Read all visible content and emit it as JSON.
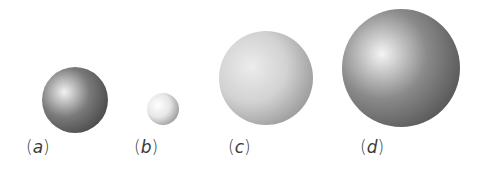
{
  "figure": {
    "spheres": [
      {
        "id": "a",
        "label_letter": "a",
        "open_paren": "(",
        "close_paren": ")",
        "cx": 75,
        "cy": 100,
        "r": 33,
        "colors": {
          "highlight": "#f2f2f2",
          "mid": "#7a7a7a",
          "shadow": "#2e2e2e"
        }
      },
      {
        "id": "b",
        "label_letter": "b",
        "open_paren": "(",
        "close_paren": ")",
        "cx": 163,
        "cy": 109,
        "r": 16,
        "colors": {
          "highlight": "#ffffff",
          "mid": "#e6e6e6",
          "shadow": "#6e6e6e"
        }
      },
      {
        "id": "c",
        "label_letter": "c",
        "open_paren": "(",
        "close_paren": ")",
        "cx": 266,
        "cy": 78,
        "r": 47,
        "colors": {
          "highlight": "#ececec",
          "mid": "#d2d2d2",
          "shadow": "#7a7a7a"
        }
      },
      {
        "id": "d",
        "label_letter": "d",
        "open_paren": "(",
        "close_paren": ")",
        "cx": 401,
        "cy": 68,
        "r": 59,
        "colors": {
          "highlight": "#f4f4f4",
          "mid": "#8a8a8a",
          "shadow": "#3a3a3a"
        }
      }
    ],
    "labels_y": 137,
    "label_x": [
      26,
      134,
      228,
      360
    ]
  }
}
